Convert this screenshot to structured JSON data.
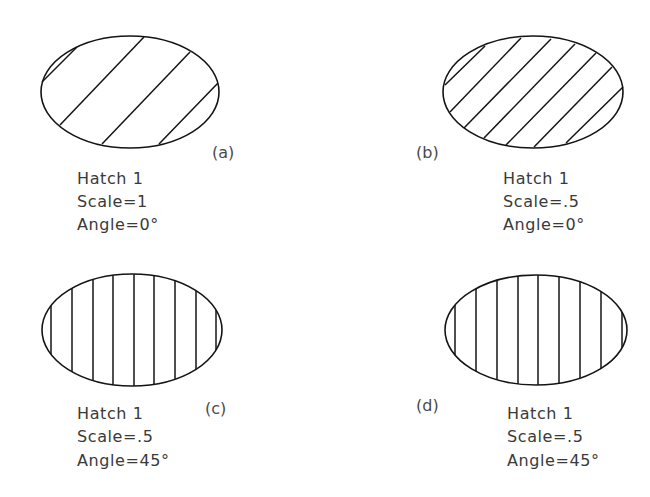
{
  "figures": [
    {
      "id": "a",
      "tag": "(a)",
      "lines": [
        "Hatch 1",
        "Scale=1",
        "Angle=0°"
      ],
      "pattern": "Hatch 1",
      "scale": "1",
      "angle": "0°",
      "hatch_direction": "diagonal",
      "hatch_line_count": 4
    },
    {
      "id": "b",
      "tag": "(b)",
      "lines": [
        "Hatch 1",
        "Scale=.5",
        "Angle=0°"
      ],
      "pattern": "Hatch 1",
      "scale": ".5",
      "angle": "0°",
      "hatch_direction": "diagonal",
      "hatch_line_count": 7
    },
    {
      "id": "c",
      "tag": "(c)",
      "lines": [
        "Hatch 1",
        "Scale=.5",
        "Angle=45°"
      ],
      "pattern": "Hatch 1",
      "scale": ".5",
      "angle": "45°",
      "hatch_direction": "vertical",
      "hatch_line_count": 9
    },
    {
      "id": "d",
      "tag": "(d)",
      "lines": [
        "Hatch 1",
        "Scale=.5",
        "Angle=45°"
      ],
      "pattern": "Hatch 1",
      "scale": ".5",
      "angle": "45°",
      "hatch_direction": "vertical",
      "hatch_line_count": 9
    }
  ],
  "colors": {
    "stroke": "#141414",
    "text": "#3a3a3a",
    "background": "#ffffff"
  }
}
